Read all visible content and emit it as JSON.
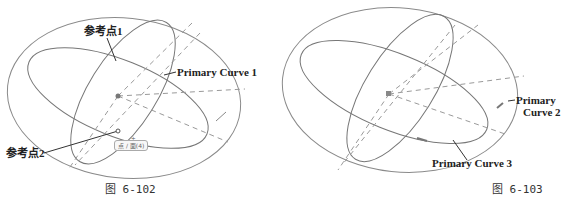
{
  "figures": [
    {
      "caption": "图 6-102",
      "labels": {
        "ref_point_1": "参考点1",
        "ref_point_2": "参考点2",
        "primary_curve_1": "Primary Curve 1",
        "point_tag": "点 / 面(4)"
      }
    },
    {
      "caption": "图 6-103",
      "labels": {
        "primary_curve_2_line1": "Primary",
        "primary_curve_2_line2": "Curve 2",
        "primary_curve_3": "Primary Curve 3"
      }
    }
  ],
  "colors": {
    "curve": "#8a8a8a",
    "dashed": "#9a9a9a",
    "leader": "#333333",
    "text": "#222222"
  }
}
